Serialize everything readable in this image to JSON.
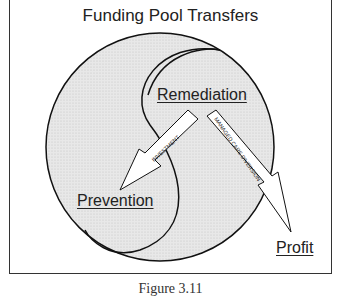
{
  "figure": {
    "title": "Funding Pool Transfers",
    "caption": "Figure 3.11",
    "pools": [
      {
        "name": "Remediation"
      },
      {
        "name": "Prevention"
      },
      {
        "name": "Profit"
      }
    ],
    "arrows": [
      {
        "label": "INVESTMENT",
        "from": "Remediation",
        "to": "Prevention"
      },
      {
        "label": "MANAGED CARE DIVERSION",
        "from": "Remediation",
        "to": "Profit"
      }
    ],
    "colors": {
      "fill": "#e6e6e6",
      "stroke": "#111111",
      "frame": "#333333"
    }
  }
}
